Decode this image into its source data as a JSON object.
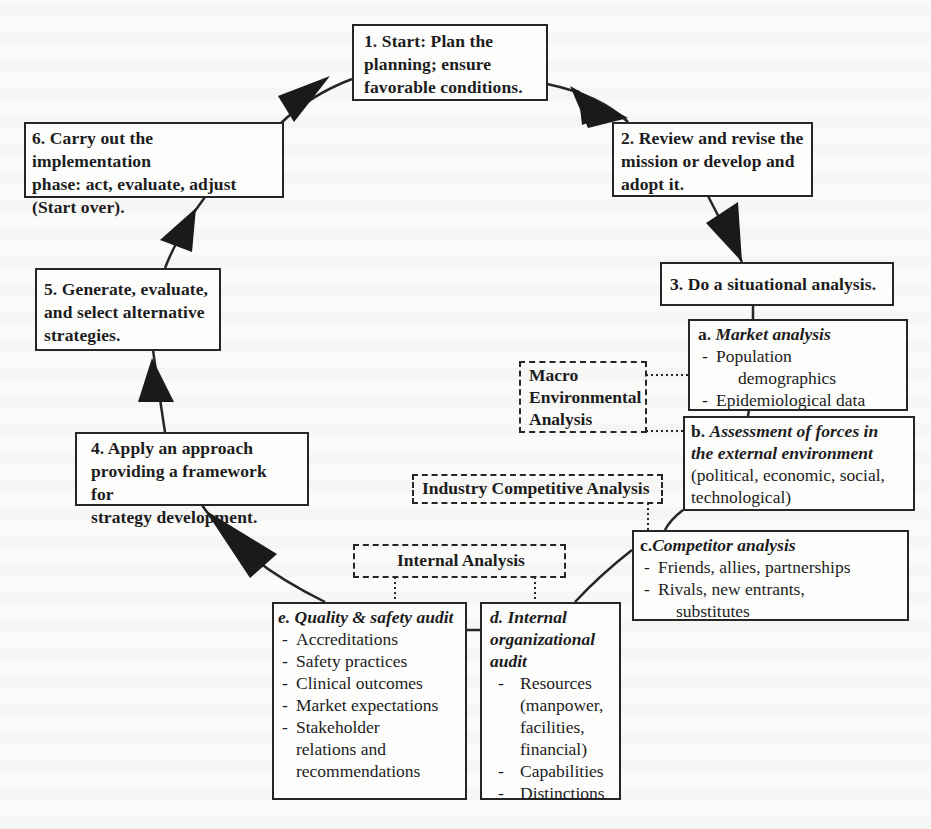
{
  "diagram": {
    "type": "cyclic-flowchart",
    "steps": [
      {
        "id": "1",
        "label": "1. Start: Plan the planning; ensure favorable conditions."
      },
      {
        "id": "2",
        "label": "2. Review and revise the mission or develop and adopt it."
      },
      {
        "id": "3",
        "label": "3. Do a situational analysis."
      },
      {
        "id": "4",
        "label": "4. Apply an approach providing a framework for strategy development."
      },
      {
        "id": "5",
        "label": "5. Generate, evaluate, and select alternative strategies."
      },
      {
        "id": "6",
        "label": "6. Carry out the implementation phase: act, evaluate, adjust (Start over)."
      }
    ],
    "step_lines": {
      "s1": [
        "1. Start: Plan the",
        "planning; ensure",
        "favorable conditions."
      ],
      "s2": [
        "2. Review and revise the",
        "mission or develop and",
        "adopt it."
      ],
      "s3": [
        "3. Do a situational analysis."
      ],
      "s4": [
        "4. Apply an approach",
        "providing a framework for",
        "strategy development."
      ],
      "s5": [
        "5. Generate, evaluate,",
        "and select alternative",
        "strategies."
      ],
      "s6": [
        "6. Carry out the implementation",
        "phase: act, evaluate, adjust",
        "(Start over)."
      ]
    },
    "sub_analyses": {
      "a": {
        "letter": "a.",
        "title": "Market analysis",
        "items": [
          "Population",
          "demographics",
          "Epidemiological data"
        ]
      },
      "b": {
        "letter": "b.",
        "title_line1": "Assessment of forces in",
        "title_line2": "the external environment",
        "desc_line1": "(political, economic, social,",
        "desc_line2": "technological)"
      },
      "c": {
        "letter": "c.",
        "title": "Competitor analysis",
        "items": [
          "Friends, allies, partnerships",
          "Rivals, new entrants,",
          "substitutes"
        ]
      },
      "d": {
        "title_line1": "d. Internal",
        "title_line2": "organizational",
        "title_line3": "audit",
        "items": [
          "Resources",
          "(manpower,",
          "facilities,",
          "financial)",
          "Capabilities",
          "Distinctions"
        ]
      },
      "e": {
        "title": "e. Quality & safety audit",
        "items": [
          "Accreditations",
          "Safety practices",
          "Clinical outcomes",
          "Market expectations",
          "Stakeholder",
          "relations and",
          "recommendations"
        ]
      }
    },
    "groups": {
      "macro": {
        "line1": "Macro",
        "line2": "Environmental",
        "line3": "Analysis"
      },
      "industry": {
        "label": "Industry Competitive Analysis"
      },
      "internal": {
        "label": "Internal Analysis"
      }
    },
    "colors": {
      "line": "#262626",
      "background": "#fbfbfa",
      "box_fill": "#fdfdfc"
    }
  }
}
